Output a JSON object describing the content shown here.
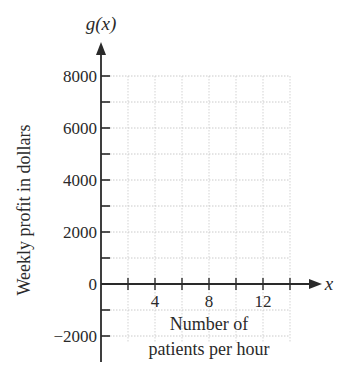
{
  "chart_data": {
    "type": "line",
    "title": "",
    "xlabel": "Number of patients per hour",
    "xlabel_lines": [
      "Number of",
      "patients per hour"
    ],
    "ylabel": "Weekly profit in dollars",
    "x_var": "x",
    "y_var": "g(x)",
    "xlim": [
      0,
      15
    ],
    "ylim": [
      -2000,
      8000
    ],
    "x_ticks": [
      2,
      4,
      6,
      8,
      10,
      12,
      14
    ],
    "x_tick_labels": [
      "",
      "4",
      "",
      "8",
      "",
      "12",
      ""
    ],
    "y_ticks": [
      -2000,
      -1000,
      0,
      1000,
      2000,
      3000,
      4000,
      5000,
      6000,
      7000,
      8000
    ],
    "y_tick_labels": [
      "−2000",
      "",
      "0",
      "",
      "2000",
      "",
      "4000",
      "",
      "6000",
      "",
      "8000"
    ],
    "grid": true,
    "grid_style": "dotted",
    "series": [],
    "legend": null
  }
}
